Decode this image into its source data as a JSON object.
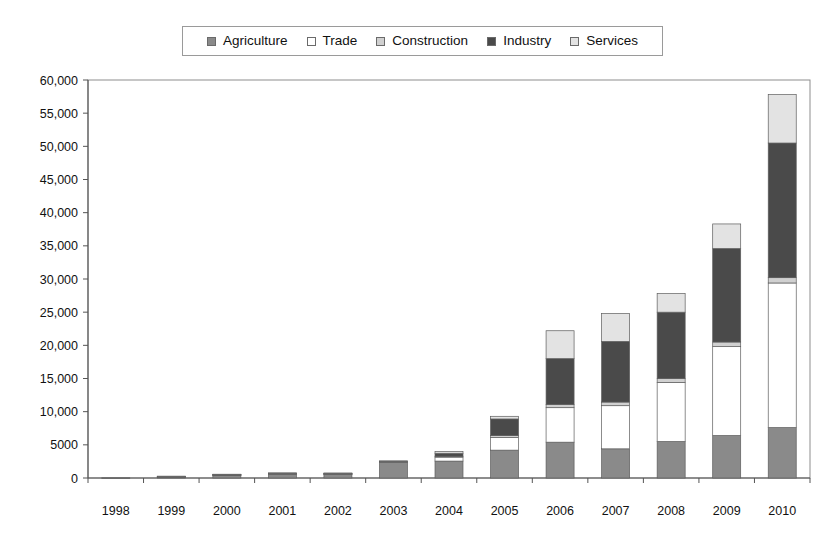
{
  "legend": {
    "position": "top-center",
    "items": [
      {
        "label": "Agriculture",
        "color": "#8a8a8a"
      },
      {
        "label": "Trade",
        "color": "#ffffff"
      },
      {
        "label": "Construction",
        "color": "#d0d0d0"
      },
      {
        "label": "Industry",
        "color": "#4a4a4a"
      },
      {
        "label": "Services",
        "color": "#e3e3e3"
      }
    ]
  },
  "axis": {
    "y_ticks": [
      "0",
      "5000",
      "10,000",
      "15,000",
      "20,000",
      "25,000",
      "30,000",
      "35,000",
      "40,000",
      "45,000",
      "50,000",
      "55,000",
      "60,000"
    ],
    "x_ticks": [
      "1998",
      "1999",
      "2000",
      "2001",
      "2002",
      "2003",
      "2004",
      "2005",
      "2006",
      "2007",
      "2008",
      "2009",
      "2010"
    ]
  },
  "chart_data": {
    "type": "bar",
    "subtype": "stacked",
    "title": "",
    "subtitle": "",
    "xlabel": "",
    "ylabel": "",
    "ylim": [
      0,
      60000
    ],
    "ytick_step": 5000,
    "grid": false,
    "legend_position": "top-center",
    "categories": [
      "1998",
      "1999",
      "2000",
      "2001",
      "2002",
      "2003",
      "2004",
      "2005",
      "2006",
      "2007",
      "2008",
      "2009",
      "2010"
    ],
    "series": [
      {
        "name": "Agriculture",
        "color": "#8a8a8a",
        "values": [
          30,
          200,
          430,
          560,
          540,
          2450,
          2550,
          4200,
          5400,
          4400,
          5500,
          6400,
          7600
        ]
      },
      {
        "name": "Trade",
        "color": "#ffffff",
        "values": [
          0,
          30,
          60,
          90,
          90,
          50,
          600,
          1900,
          5200,
          6500,
          8900,
          13400,
          21800
        ]
      },
      {
        "name": "Construction",
        "color": "#d0d0d0",
        "values": [
          0,
          10,
          20,
          30,
          30,
          20,
          130,
          300,
          500,
          550,
          600,
          700,
          800
        ]
      },
      {
        "name": "Industry",
        "color": "#4a4a4a",
        "values": [
          0,
          20,
          40,
          60,
          60,
          30,
          450,
          2500,
          6900,
          9150,
          10000,
          14100,
          20300
        ]
      },
      {
        "name": "Services",
        "color": "#e3e3e3",
        "values": [
          0,
          10,
          20,
          30,
          30,
          20,
          270,
          400,
          4200,
          4200,
          2800,
          3700,
          7300
        ]
      }
    ],
    "totals": [
      30,
      270,
      570,
      770,
      750,
      2570,
      4000,
      9300,
      22200,
      24800,
      27800,
      38300,
      57800
    ]
  }
}
